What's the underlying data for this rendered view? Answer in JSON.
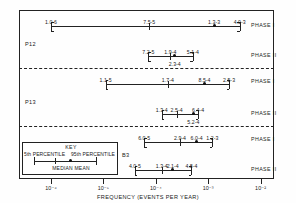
{
  "figure": {
    "axis_title": "FREQUENCY (EVENTS PER YEAR)",
    "x_ticks": [
      "10-6",
      "10-5",
      "10-4",
      "10-3",
      "10-2"
    ],
    "x_tick_html": [
      "10⁻⁶",
      "10⁻⁵",
      "10⁻⁴",
      "10⁻³",
      "10⁻²"
    ]
  },
  "key": {
    "title": "KEY",
    "p5_label": "5th PERCENTILE",
    "p95_label": "95th PERCENTILE",
    "footer": "MEDIAN   MEAN"
  },
  "groups": [
    {
      "label": "P12"
    },
    {
      "label": "P13"
    },
    {
      "label": "B3"
    }
  ],
  "phase_labels": [
    "PHASE I",
    "PHASE II",
    "PHASE I",
    "PHASE II",
    "PHASE I",
    "PHASE II"
  ],
  "chart_data": {
    "type": "bar",
    "title": "",
    "xlabel": "FREQUENCY (EVENTS PER YEAR)",
    "ylabel": "",
    "xscale": "log",
    "xlim": [
      1e-06,
      0.01
    ],
    "xticks": [
      1e-06,
      1e-05,
      0.0001,
      0.001,
      0.01
    ],
    "xticklabels": [
      "10^-6",
      "10^-5",
      "10^-4",
      "10^-3",
      "10^-2"
    ],
    "grid": false,
    "legend": "KEY box: 5th PERCENTILE / 95th PERCENTILE caps, MEDIAN tick, MEAN dot",
    "categories": [
      "P12 PHASE I",
      "P12 PHASE II",
      "P13 PHASE I",
      "P13 PHASE II",
      "B3 PHASE I",
      "B3 PHASE II"
    ],
    "series": [
      {
        "name": "P12 PHASE I",
        "group": "P12",
        "phase": "PHASE I",
        "p5": 1e-06,
        "p5_label": "1.0-6",
        "median": 7.5e-05,
        "median_label": "7.5-5",
        "mean": 0.0013,
        "mean_label": "1.3-3",
        "p95": 0.004,
        "p95_label": "4.0-3"
      },
      {
        "name": "P12 PHASE II",
        "group": "P12",
        "phase": "PHASE II",
        "p5": 7.2e-05,
        "p5_label": "7.2-5",
        "median": 0.00019,
        "median_label": "1.9-4",
        "mean": 0.00023,
        "mean_label": "2.3-4",
        "p95": 0.00051,
        "p95_label": "5.1-4"
      },
      {
        "name": "P13 PHASE I",
        "group": "P13",
        "phase": "PHASE I",
        "p5": 1.1e-05,
        "p5_label": "1.1-5",
        "median": 0.00017,
        "median_label": "1.7-4",
        "mean": 0.00085,
        "mean_label": "8.5-4",
        "p95": 0.0025,
        "p95_label": "2.5-3"
      },
      {
        "name": "P13 PHASE II",
        "group": "P13",
        "phase": "PHASE II",
        "p5": 0.00013,
        "p5_label": "1.3-4",
        "median": 0.00025,
        "median_label": "2.5-4",
        "mean": 0.00052,
        "mean_label": "5.2-4",
        "p95": 0.00064,
        "p95_label": "6.4-4"
      },
      {
        "name": "B3 PHASE I",
        "group": "B3",
        "phase": "PHASE I",
        "p5": 6e-05,
        "p5_label": "6.0-5",
        "median": 0.00029,
        "median_label": "2.9-4",
        "mean": 0.0006,
        "mean_label": "6.0-4",
        "p95": 0.0012,
        "p95_label": "1.2-3"
      },
      {
        "name": "B3 PHASE II",
        "group": "B3",
        "phase": "PHASE II",
        "p5": 4e-05,
        "p5_label": "4.0-5",
        "median": 0.00013,
        "median_label": "1.3-4",
        "mean": 0.00021,
        "mean_label": "2.1-4",
        "p95": 0.00048,
        "p95_label": "4.8-4"
      }
    ]
  }
}
